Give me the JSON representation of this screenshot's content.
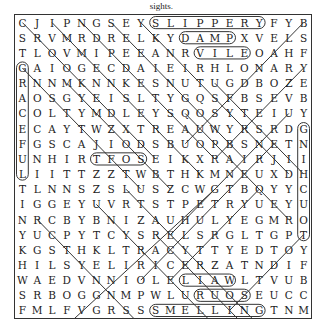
{
  "caption": "sights.",
  "puzzle": {
    "rows": 20,
    "cols": 20,
    "grid": [
      "CJIPNGSEYSLIPPERYFYB",
      "SRVMRDRELKYDAMPXVELS",
      "TLOVMIPEEANRVILEOAHF",
      "GAIOGECDAIEIRHLONARY",
      "RNNMKNNKESNUTUGDBOZE",
      "AOSGYEISLTYGQSFBSEVB",
      "COLTYMDLEYSQOSYTEIUY",
      "ECAYTWZXTREAUWYRSRDG",
      "FGSCAJIODSBUOPBSNETN",
      "UNHIRTFOSEIKXRAIRJII",
      "LIITTZZTWBTHKMNEUXDH",
      "TLNNSZSLUSZCWGTBQYYC",
      "IGGEYUVRTSTPETRYUEYU",
      "NRCBYBNIZAUHULYEGMRO",
      "YUCPYTCYSRELSRGLTGPT",
      "KGSTHKLTRACYTTYEDTOY",
      "HILSYELIRICERZATNDIF",
      "WAEDVNNIOLELIAWLTVUB",
      "SRBOGGNMPWLURUOSEUCC",
      "FMLFVGRSSSMELLINGTNM"
    ],
    "found_words_horizontal": [
      {
        "word": "SLIPPERY",
        "row": 1,
        "start_col": 10,
        "end_col": 17
      },
      {
        "word": "DAMP",
        "row": 2,
        "start_col": 12,
        "end_col": 15
      },
      {
        "word": "VILE",
        "row": 3,
        "start_col": 13,
        "end_col": 16
      },
      {
        "word": "SOFT",
        "row": 10,
        "start_col": 6,
        "end_col": 9
      },
      {
        "word": "WAIL",
        "row": 18,
        "start_col": 12,
        "end_col": 15
      },
      {
        "word": "SOUR",
        "row": 19,
        "start_col": 13,
        "end_col": 16
      },
      {
        "word": "SMELLING",
        "row": 20,
        "start_col": 10,
        "end_col": 17
      }
    ],
    "found_words_vertical": [
      {
        "word": "GRACEFUL",
        "col": 1,
        "start_row": 4,
        "end_row": 11
      },
      {
        "word": "TOUCHING",
        "col": 20,
        "start_row": 8,
        "end_row": 15
      }
    ]
  }
}
